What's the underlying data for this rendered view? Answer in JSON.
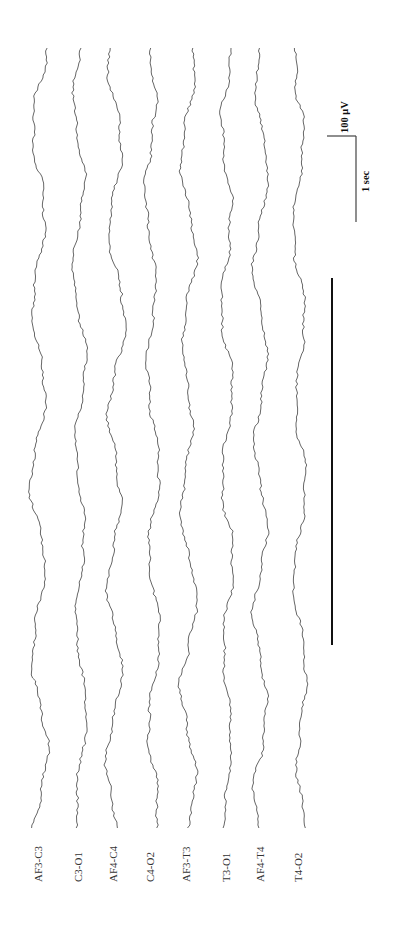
{
  "figure": {
    "type": "eeg-traces-rotated",
    "orientation": "rotated -90deg (time runs bottom to top)",
    "trace_color": "#555555",
    "background": "#ffffff"
  },
  "channels": [
    {
      "label": "AF3-C3",
      "x": 40
    },
    {
      "label": "C3-O1",
      "x": 80
    },
    {
      "label": "AF4-C4",
      "x": 115
    },
    {
      "label": "C4-O2",
      "x": 152
    },
    {
      "label": "AF3-T3",
      "x": 188
    },
    {
      "label": "T3-O1",
      "x": 228
    },
    {
      "label": "AF4-T4",
      "x": 262
    },
    {
      "label": "T4-O2",
      "x": 300
    }
  ],
  "scale_bar": {
    "amplitude_label": "100 μV",
    "time_label": "1 sec"
  },
  "event_marker": {
    "description": "thick bar marking event period",
    "x": 332,
    "y_start": 278,
    "y_end": 645
  }
}
